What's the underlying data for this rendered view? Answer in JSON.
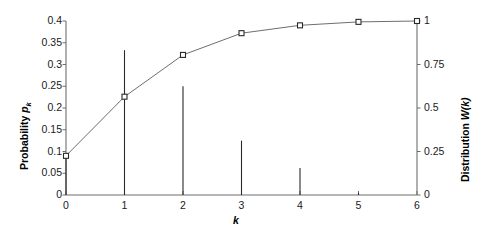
{
  "chart_data": {
    "type": "line",
    "title": "",
    "xlabel": "k",
    "ylabel": "Probability p_k",
    "y2label": "Distribution W(k)",
    "x": [
      0,
      1,
      2,
      3,
      4,
      5,
      6
    ],
    "xlim": [
      0,
      6
    ],
    "xticks": [
      "0",
      "1",
      "2",
      "3",
      "4",
      "5",
      "6"
    ],
    "ylim": [
      0,
      0.4
    ],
    "yticks": [
      "0",
      "0.05",
      "0.1",
      "0.15",
      "0.2",
      "0.25",
      "0.3",
      "0.35",
      "0.4"
    ],
    "ytick_values": [
      0,
      0.05,
      0.1,
      0.15,
      0.2,
      0.25,
      0.3,
      0.35,
      0.4
    ],
    "y2lim": [
      0,
      1
    ],
    "y2ticks": [
      "0",
      "0.25",
      "0.5",
      "0.75",
      "1"
    ],
    "y2tick_values": [
      0,
      0.25,
      0.5,
      0.75,
      1
    ],
    "grid": false,
    "legend": "none",
    "series": [
      {
        "name": "Probability p_k",
        "style": "stem",
        "axis": "left",
        "values": [
          0.09,
          0.333,
          0.25,
          0.125,
          0.062,
          0.005,
          0.0
        ]
      },
      {
        "name": "Distribution W(k)",
        "style": "line-with-open-square-markers",
        "axis": "right",
        "values": [
          0.225,
          0.565,
          0.805,
          0.93,
          0.975,
          0.995,
          1.0
        ]
      }
    ],
    "colors": {
      "axis": "#6e6e6e",
      "stem": "#2a2a2a",
      "marker_edge": "#2a2a2a",
      "marker_face": "#ffffff",
      "cdf_line": "#6e6e6e",
      "text": "#111111"
    }
  },
  "axes": {
    "left_title_main": "Probability ",
    "left_title_var": "p",
    "left_title_sub": "k",
    "right_title_main": "Distribution ",
    "right_title_var": "W(k)",
    "x_title": "k"
  }
}
